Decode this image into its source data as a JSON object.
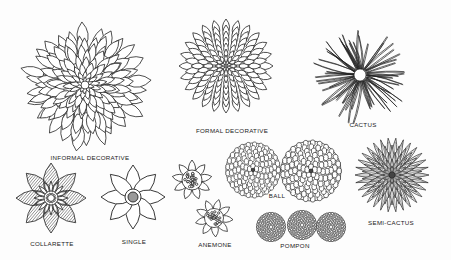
{
  "figure": {
    "background": "#fdfdfd",
    "ink": "#222222"
  },
  "flowers": [
    {
      "id": "informal-decorative",
      "label": "INFORMAL DECORATIVE",
      "cx": 85,
      "cy": 85,
      "r": 66,
      "label_x": 90,
      "label_y": 157
    },
    {
      "id": "formal-decorative",
      "label": "FORMAL DECORATIVE",
      "cx": 226,
      "cy": 66,
      "r": 48,
      "label_x": 232,
      "label_y": 130
    },
    {
      "id": "cactus",
      "label": "CACTUS",
      "cx": 360,
      "cy": 75,
      "r": 52,
      "label_x": 363,
      "label_y": 124
    },
    {
      "id": "collarette",
      "label": "COLLARETTE",
      "cx": 51,
      "cy": 198,
      "r": 36,
      "label_x": 52,
      "label_y": 243
    },
    {
      "id": "single",
      "label": "SINGLE",
      "cx": 133,
      "cy": 197,
      "r": 33,
      "label_x": 134,
      "label_y": 241
    },
    {
      "id": "anemone-1",
      "label": "",
      "cx": 192,
      "cy": 180,
      "r": 21
    },
    {
      "id": "anemone-2",
      "label": "ANEMONE",
      "cx": 214,
      "cy": 218,
      "r": 20,
      "label_x": 215,
      "label_y": 244
    },
    {
      "id": "ball-1",
      "label": "",
      "cx": 253,
      "cy": 170,
      "r": 28
    },
    {
      "id": "ball-2",
      "label": "BALL",
      "cx": 311,
      "cy": 171,
      "r": 31,
      "label_x": 276,
      "label_y": 194
    },
    {
      "id": "pompon-1",
      "label": "",
      "cx": 271,
      "cy": 227,
      "r": 15
    },
    {
      "id": "pompon-2",
      "label": "POMPON",
      "cx": 302,
      "cy": 225,
      "r": 15,
      "label_x": 295,
      "label_y": 245
    },
    {
      "id": "pompon-3",
      "label": "",
      "cx": 331,
      "cy": 227,
      "r": 15
    },
    {
      "id": "semi-cactus",
      "label": "SEMI-CACTUS",
      "cx": 392,
      "cy": 175,
      "r": 38,
      "label_x": 391,
      "label_y": 223
    }
  ],
  "labels": {
    "informal_decorative": "INFORMAL DECORATIVE",
    "formal_decorative": "FORMAL DECORATIVE",
    "cactus": "CACTUS",
    "collarette": "COLLARETTE",
    "single": "SINGLE",
    "anemone": "ANEMONE",
    "ball": "BALL",
    "pompon": "POMPON",
    "semi_cactus": "SEMI-CACTUS"
  }
}
